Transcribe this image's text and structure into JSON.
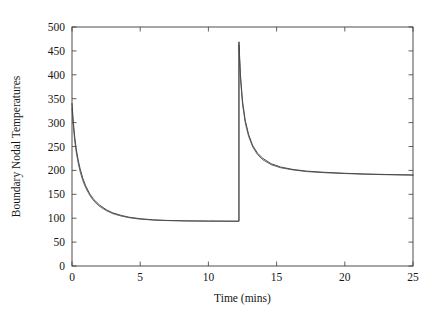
{
  "chart_data": {
    "type": "line",
    "title": "",
    "subtitle": "",
    "xlabel": "Time  (mins)",
    "ylabel": "Boundary  Nodal  Temperatures",
    "xlim": [
      0,
      25
    ],
    "ylim": [
      0,
      500
    ],
    "xticks": [
      0,
      5,
      10,
      15,
      20,
      25
    ],
    "yticks": [
      0,
      50,
      100,
      150,
      200,
      250,
      300,
      350,
      400,
      450,
      500
    ],
    "xtick_labels": [
      "0",
      "5",
      "10",
      "15",
      "20",
      "25"
    ],
    "ytick_labels": [
      "0",
      "50",
      "100",
      "150",
      "200",
      "250",
      "300",
      "350",
      "400",
      "450",
      "500"
    ],
    "grid": false,
    "legend": null,
    "legend_position": "none",
    "annotations": [],
    "line_color": "#2b2b2b",
    "series": [
      {
        "name": "node-1",
        "color": "#2b2b2b",
        "x": [
          0,
          0.1,
          0.2,
          0.3,
          0.45,
          0.6,
          0.8,
          1.0,
          1.3,
          1.6,
          2.0,
          2.5,
          3.0,
          3.6,
          4.2,
          5.0,
          6.0,
          7.0,
          8.5,
          10.0,
          11.5,
          12.24,
          12.24,
          12.35,
          12.5,
          12.7,
          12.95,
          13.25,
          13.6,
          14.0,
          14.6,
          15.3,
          16.2,
          17.2,
          18.5,
          20.0,
          21.5,
          23.0,
          25.0
        ],
        "y": [
          340,
          300,
          270,
          247,
          222,
          203,
          183,
          168,
          151,
          139,
          128,
          118,
          111,
          106,
          102,
          99,
          96.5,
          95.3,
          94.4,
          94.0,
          93.8,
          93.7,
          469,
          400,
          345,
          305,
          275,
          252,
          236,
          225,
          214,
          207,
          202,
          198.5,
          196,
          194,
          192.5,
          191.5,
          190.5
        ]
      },
      {
        "name": "node-2",
        "color": "#4a4a4a",
        "x": [
          0,
          0.1,
          0.2,
          0.3,
          0.45,
          0.6,
          0.8,
          1.0,
          1.3,
          1.6,
          2.0,
          2.5,
          3.0,
          3.6,
          4.2,
          5.0,
          6.0,
          7.0,
          8.5,
          10.0,
          11.5,
          12.24,
          12.24,
          12.35,
          12.5,
          12.7,
          12.95,
          13.25,
          13.6,
          14.0,
          14.6,
          15.3,
          16.2,
          17.2,
          18.5,
          20.0,
          21.5,
          23.0,
          25.0
        ],
        "y": [
          330,
          292,
          262,
          240,
          216,
          197,
          178,
          164,
          148,
          136,
          125,
          116,
          109.5,
          104.5,
          101,
          98,
          96,
          95,
          94.2,
          93.9,
          93.7,
          93.6,
          462,
          393,
          339,
          300,
          271,
          249,
          233,
          222,
          212,
          205.5,
          201,
          197.5,
          195.2,
          193.4,
          192,
          191,
          190
        ]
      }
    ]
  },
  "plot_geometry": {
    "left_px": 72,
    "right_px": 413,
    "top_px": 27,
    "bottom_px": 266
  }
}
